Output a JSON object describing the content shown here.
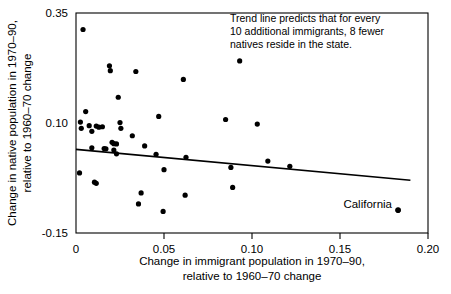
{
  "chart_data": {
    "type": "scatter",
    "title": "",
    "xlabel": "Change in immigrant population in 1970–90, relative to 1960–70 change",
    "xlabel_line1": "Change in immigrant population in 1970–90,",
    "xlabel_line2": "relative to 1960–70 change",
    "ylabel": "Change in native population in 1970–90, relative to 1960–70 change",
    "ylabel_line1": "Change in native population in 1970–90,",
    "ylabel_line2": "relative to 1960–70 change",
    "xlim": [
      0,
      0.2
    ],
    "ylim": [
      -0.15,
      0.35
    ],
    "xticks": [
      0,
      0.05,
      0.1,
      0.15,
      0.2
    ],
    "xticklabels": [
      "0",
      "0.05",
      "0.10",
      "0.15",
      "0.20"
    ],
    "yticks": [
      0.35,
      0.1,
      -0.15
    ],
    "yticklabels": [
      "0.35",
      "0.10",
      "-0.15"
    ],
    "grid": false,
    "legend": "none",
    "annotations": [
      {
        "name": "trend-note",
        "line1": "Trend line predicts that for every",
        "line2": "10 additional immigrants, 8 fewer",
        "line3": "natives reside in the state."
      },
      {
        "name": "california-callout",
        "text": "California",
        "x": 0.183,
        "y": -0.098
      }
    ],
    "trend_line": {
      "name": "trend-line",
      "x0": 0.0,
      "y0": 0.04,
      "x1": 0.19,
      "y1": -0.03,
      "slope": -0.8
    },
    "series": [
      {
        "name": "US states",
        "marker": "filled-circle",
        "color": "#000000",
        "points": [
          [
            0.004,
            0.3125
          ],
          [
            0.0025,
            0.102
          ],
          [
            0.003,
            0.088
          ],
          [
            0.0055,
            0.126
          ],
          [
            0.0075,
            0.094
          ],
          [
            0.009,
            0.081
          ],
          [
            0.0115,
            0.093
          ],
          [
            0.013,
            0.0905
          ],
          [
            0.015,
            0.0915
          ],
          [
            0.016,
            0.042
          ],
          [
            0.017,
            0.0415
          ],
          [
            0.009,
            0.0435
          ],
          [
            0.002,
            -0.0135
          ],
          [
            0.0105,
            -0.0345
          ],
          [
            0.0115,
            -0.037
          ],
          [
            0.019,
            0.23
          ],
          [
            0.0195,
            0.219
          ],
          [
            0.0205,
            0.056
          ],
          [
            0.0215,
            0.053
          ],
          [
            0.023,
            0.0525
          ],
          [
            0.024,
            0.1585
          ],
          [
            0.025,
            0.101
          ],
          [
            0.0255,
            0.088
          ],
          [
            0.023,
            0.03
          ],
          [
            0.0215,
            0.0385
          ],
          [
            0.032,
            0.071
          ],
          [
            0.034,
            0.217
          ],
          [
            0.0355,
            -0.084
          ],
          [
            0.037,
            -0.059
          ],
          [
            0.039,
            0.048
          ],
          [
            0.0455,
            0.029
          ],
          [
            0.047,
            0.115
          ],
          [
            0.0495,
            -0.101
          ],
          [
            0.05,
            -0.006
          ],
          [
            0.061,
            0.199
          ],
          [
            0.062,
            -0.064
          ],
          [
            0.0625,
            0.022
          ],
          [
            0.085,
            0.108
          ],
          [
            0.088,
            -0.001
          ],
          [
            0.089,
            -0.0465
          ],
          [
            0.093,
            0.241
          ],
          [
            0.103,
            0.0975
          ],
          [
            0.109,
            0.0135
          ],
          [
            0.1215,
            0.0015
          ],
          [
            0.183,
            -0.0985
          ]
        ]
      }
    ]
  }
}
